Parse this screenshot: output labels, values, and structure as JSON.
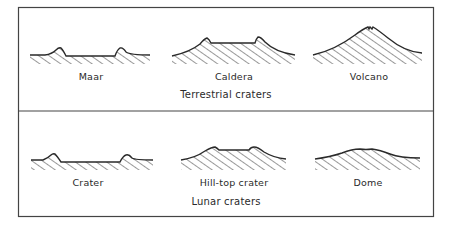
{
  "figure": {
    "panels": [
      {
        "id": "terrestrial",
        "caption": "Terrestrial craters",
        "profiles": [
          {
            "name": "maar",
            "label": "Maar"
          },
          {
            "name": "caldera",
            "label": "Caldera"
          },
          {
            "name": "volcano",
            "label": "Volcano"
          }
        ]
      },
      {
        "id": "lunar",
        "caption": "Lunar craters",
        "profiles": [
          {
            "name": "crater",
            "label": "Crater"
          },
          {
            "name": "hill-top-crater",
            "label": "Hill-top crater"
          },
          {
            "name": "dome",
            "label": "Dome"
          }
        ]
      }
    ],
    "colors": {
      "line": "#2a2a2a",
      "frame": "#444444",
      "background": "#ffffff"
    }
  }
}
